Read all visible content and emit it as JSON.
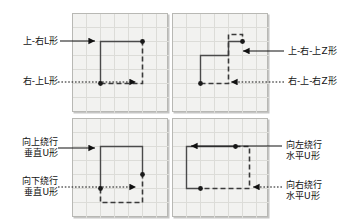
{
  "figure": {
    "title": "",
    "background_color": "#ffffff",
    "panel_fill": "#f2f2f0",
    "panel_border": "#b8b8b4",
    "grid_color": "#d8d8d4",
    "path_color": "#444444",
    "dot_color": "#1a1a1a",
    "leader_color": "#111111"
  },
  "panels": [
    {
      "id": "panel-top-left",
      "name": "L-shape-panel",
      "labels": [
        {
          "id": "label-up-right-L",
          "text": "上-右L形",
          "style": "solid"
        },
        {
          "id": "label-right-up-L",
          "text": "右-上L形",
          "style": "dotted"
        }
      ]
    },
    {
      "id": "panel-top-right",
      "name": "Z-shape-panel",
      "labels": [
        {
          "id": "label-up-right-up-Z",
          "text": "上-右-上Z形",
          "style": "solid"
        },
        {
          "id": "label-right-up-right-Z",
          "text": "右-上-右Z形",
          "style": "dotted"
        }
      ]
    },
    {
      "id": "panel-bottom-left",
      "name": "vertical-U-shape-panel",
      "labels": [
        {
          "id": "label-detour-up-vertical-U",
          "text": "向上绕行\n垂直U形",
          "line1": "向上绕行",
          "line2": "垂直U形",
          "style": "solid"
        },
        {
          "id": "label-detour-down-vertical-U",
          "text": "向下绕行\n垂直U形",
          "line1": "向下绕行",
          "line2": "垂直U形",
          "style": "dotted"
        }
      ]
    },
    {
      "id": "panel-bottom-right",
      "name": "horizontal-U-shape-panel",
      "labels": [
        {
          "id": "label-detour-left-horizontal-U",
          "text": "向左绕行\n水平U形",
          "line1": "向左绕行",
          "line2": "水平U形",
          "style": "solid"
        },
        {
          "id": "label-detour-right-horizontal-U",
          "text": "向右绕行\n水平U形",
          "line1": "向右绕行",
          "line2": "水平U形",
          "style": "dotted"
        }
      ]
    }
  ],
  "labels": {
    "tl_solid": "上-右L形",
    "tl_dotted": "右-上L形",
    "tr_solid": "上-右-上Z形",
    "tr_dotted": "右-上-右Z形",
    "bl_solid_line1": "向上绕行",
    "bl_solid_line2": "垂直U形",
    "bl_dotted_line1": "向下绕行",
    "bl_dotted_line2": "垂直U形",
    "br_solid_line1": "向左绕行",
    "br_solid_line2": "水平U形",
    "br_dotted_line1": "向右绕行",
    "br_dotted_line2": "水平U形"
  }
}
